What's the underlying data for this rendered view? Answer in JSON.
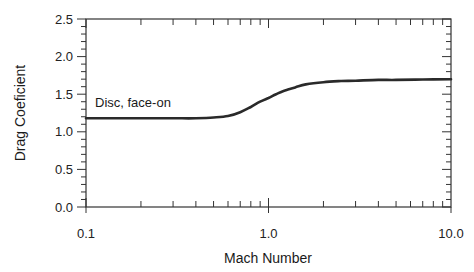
{
  "chart_data": {
    "type": "line",
    "title": "",
    "xlabel": "Mach Number",
    "ylabel": "Drag Coeficient",
    "xscale": "log",
    "xlim": [
      0.1,
      10.0
    ],
    "ylim": [
      0.0,
      2.5
    ],
    "xticks": [
      "0.1",
      "1.0",
      "10.0"
    ],
    "yticks": [
      "0.0",
      "0.5",
      "1.0",
      "1.5",
      "2.0",
      "2.5"
    ],
    "grid": false,
    "legend": null,
    "annotations": [
      {
        "text": "Disc, face-on",
        "x": 0.11,
        "y": 1.28
      }
    ],
    "series": [
      {
        "name": "Disc, face-on",
        "color": "#2a2a2a",
        "x": [
          0.1,
          0.2,
          0.3,
          0.4,
          0.5,
          0.6,
          0.7,
          0.8,
          0.9,
          1.0,
          1.1,
          1.2,
          1.4,
          1.6,
          2.0,
          2.5,
          3.0,
          4.0,
          5.0,
          7.0,
          10.0
        ],
        "values": [
          1.18,
          1.18,
          1.18,
          1.18,
          1.19,
          1.21,
          1.26,
          1.33,
          1.4,
          1.45,
          1.5,
          1.54,
          1.59,
          1.63,
          1.66,
          1.675,
          1.68,
          1.69,
          1.69,
          1.695,
          1.7
        ]
      }
    ]
  },
  "labels": {
    "xlabel": "Mach Number",
    "ylabel": "Drag Coeficient",
    "annotation": "Disc, face-on",
    "xticks": [
      "0.1",
      "1.0",
      "10.0"
    ],
    "yticks": [
      "0.0",
      "0.5",
      "1.0",
      "1.5",
      "2.0",
      "2.5"
    ]
  }
}
